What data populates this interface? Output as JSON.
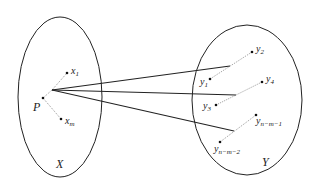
{
  "diagram": {
    "sets": [
      {
        "id": "X",
        "label": "X"
      },
      {
        "id": "Y",
        "label": "Y"
      }
    ],
    "point_P": {
      "label": "P"
    },
    "x_points": [
      {
        "base": "x",
        "sub": "1"
      },
      {
        "base": "x",
        "sub": "m"
      }
    ],
    "y_points": [
      {
        "base": "y",
        "sub": "2"
      },
      {
        "base": "y",
        "sub": "1"
      },
      {
        "base": "y",
        "sub": "4"
      },
      {
        "base": "y",
        "sub": "3"
      },
      {
        "base": "y",
        "sub": "n−m−1"
      },
      {
        "base": "y",
        "sub": "n−m−2"
      }
    ],
    "colors": {
      "stroke": "#222222",
      "dotted": "#555555"
    }
  }
}
